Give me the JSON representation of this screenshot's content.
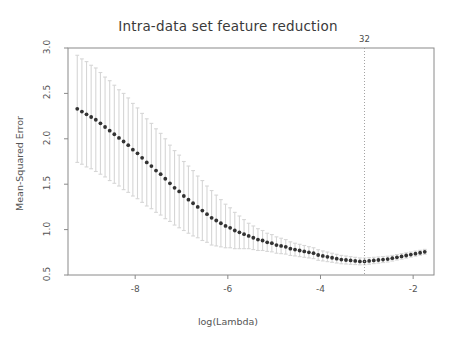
{
  "chart_data": {
    "type": "line",
    "title": "Intra-data set feature reduction",
    "xlabel": "log(Lambda)",
    "ylabel": "Mean-Squared Error",
    "xlim": [
      -9.45,
      -1.55
    ],
    "ylim": [
      0.5,
      3.0
    ],
    "xticks": [
      -8,
      -6,
      -4,
      -2
    ],
    "xtick_labels": [
      "-8",
      "-6",
      "-4",
      "-2"
    ],
    "yticks": [
      0.5,
      1.0,
      1.5,
      2.0,
      2.5,
      3.0
    ],
    "ytick_labels": [
      "0.5",
      "1.0",
      "1.5",
      "2.0",
      "2.5",
      "3.0"
    ],
    "grid": false,
    "legend": "none",
    "marker": "filled-circle",
    "marker_color": "#333333",
    "errorbar_color": "#d6d6d6",
    "annotations": [
      {
        "name": "selected-lambda-marker",
        "label": "32",
        "x": -3.05,
        "line_style": "dotted",
        "line_color": "#999999",
        "label_position": "top"
      }
    ],
    "series": [
      {
        "name": "Mean-Squared Error (cross-validation)",
        "x": [
          -9.25,
          -9.15,
          -9.05,
          -8.95,
          -8.85,
          -8.75,
          -8.65,
          -8.55,
          -8.45,
          -8.35,
          -8.25,
          -8.15,
          -8.05,
          -7.95,
          -7.85,
          -7.75,
          -7.65,
          -7.55,
          -7.45,
          -7.35,
          -7.25,
          -7.15,
          -7.05,
          -6.95,
          -6.85,
          -6.75,
          -6.65,
          -6.55,
          -6.45,
          -6.35,
          -6.25,
          -6.15,
          -6.05,
          -5.95,
          -5.85,
          -5.75,
          -5.65,
          -5.55,
          -5.45,
          -5.35,
          -5.25,
          -5.15,
          -5.05,
          -4.95,
          -4.85,
          -4.75,
          -4.65,
          -4.55,
          -4.45,
          -4.35,
          -4.25,
          -4.15,
          -4.05,
          -3.95,
          -3.85,
          -3.75,
          -3.65,
          -3.55,
          -3.45,
          -3.35,
          -3.25,
          -3.15,
          -3.05,
          -2.95,
          -2.85,
          -2.75,
          -2.65,
          -2.55,
          -2.45,
          -2.35,
          -2.25,
          -2.15,
          -2.05,
          -1.95,
          -1.85,
          -1.75
        ],
        "y": [
          2.33,
          2.3,
          2.27,
          2.24,
          2.21,
          2.17,
          2.13,
          2.09,
          2.05,
          2.01,
          1.97,
          1.93,
          1.88,
          1.84,
          1.79,
          1.74,
          1.7,
          1.65,
          1.61,
          1.56,
          1.51,
          1.46,
          1.42,
          1.37,
          1.33,
          1.29,
          1.25,
          1.21,
          1.17,
          1.13,
          1.1,
          1.07,
          1.04,
          1.02,
          0.99,
          0.97,
          0.95,
          0.93,
          0.91,
          0.89,
          0.88,
          0.86,
          0.85,
          0.83,
          0.82,
          0.81,
          0.79,
          0.78,
          0.77,
          0.76,
          0.75,
          0.74,
          0.72,
          0.71,
          0.7,
          0.69,
          0.68,
          0.67,
          0.665,
          0.66,
          0.655,
          0.65,
          0.65,
          0.655,
          0.66,
          0.665,
          0.67,
          0.675,
          0.685,
          0.695,
          0.705,
          0.715,
          0.725,
          0.735,
          0.745,
          0.755
        ],
        "yerr_upper": [
          0.59,
          0.58,
          0.58,
          0.57,
          0.57,
          0.56,
          0.55,
          0.55,
          0.54,
          0.53,
          0.53,
          0.52,
          0.51,
          0.5,
          0.49,
          0.48,
          0.47,
          0.46,
          0.45,
          0.44,
          0.42,
          0.41,
          0.4,
          0.38,
          0.37,
          0.36,
          0.34,
          0.33,
          0.31,
          0.3,
          0.28,
          0.26,
          0.24,
          0.22,
          0.2,
          0.18,
          0.16,
          0.14,
          0.13,
          0.12,
          0.11,
          0.1,
          0.095,
          0.09,
          0.085,
          0.08,
          0.075,
          0.07,
          0.068,
          0.065,
          0.062,
          0.06,
          0.058,
          0.055,
          0.053,
          0.05,
          0.048,
          0.046,
          0.044,
          0.042,
          0.04,
          0.038,
          0.037,
          0.036,
          0.035,
          0.034,
          0.033,
          0.032,
          0.031,
          0.03,
          0.03,
          0.029,
          0.028,
          0.028,
          0.027,
          0.027
        ],
        "yerr_lower": [
          0.59,
          0.58,
          0.58,
          0.57,
          0.57,
          0.56,
          0.55,
          0.55,
          0.54,
          0.53,
          0.53,
          0.52,
          0.51,
          0.5,
          0.49,
          0.48,
          0.47,
          0.46,
          0.45,
          0.44,
          0.42,
          0.41,
          0.4,
          0.38,
          0.37,
          0.36,
          0.34,
          0.33,
          0.31,
          0.3,
          0.28,
          0.26,
          0.24,
          0.22,
          0.2,
          0.18,
          0.16,
          0.14,
          0.13,
          0.12,
          0.11,
          0.1,
          0.095,
          0.09,
          0.085,
          0.08,
          0.075,
          0.07,
          0.068,
          0.065,
          0.062,
          0.06,
          0.058,
          0.055,
          0.053,
          0.05,
          0.048,
          0.046,
          0.044,
          0.042,
          0.04,
          0.038,
          0.037,
          0.036,
          0.035,
          0.034,
          0.033,
          0.032,
          0.031,
          0.03,
          0.03,
          0.029,
          0.028,
          0.028,
          0.027,
          0.027
        ]
      }
    ]
  }
}
